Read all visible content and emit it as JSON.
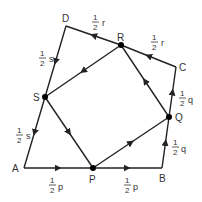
{
  "diagram": {
    "vertices": {
      "A": {
        "label": "A",
        "x": 24,
        "y": 168
      },
      "B": {
        "label": "B",
        "x": 162,
        "y": 168
      },
      "C": {
        "label": "C",
        "x": 176,
        "y": 67
      },
      "D": {
        "label": "D",
        "x": 66,
        "y": 26
      }
    },
    "midpoints": {
      "P": {
        "label": "P",
        "x": 93,
        "y": 168
      },
      "Q": {
        "label": "Q",
        "x": 169,
        "y": 117
      },
      "R": {
        "label": "R",
        "x": 121,
        "y": 45
      },
      "S": {
        "label": "S",
        "x": 45,
        "y": 97
      }
    },
    "side_labels": {
      "AP": {
        "num": "1",
        "den": "2",
        "var": "p"
      },
      "PB": {
        "num": "1",
        "den": "2",
        "var": "p"
      },
      "BQ": {
        "num": "1",
        "den": "2",
        "var": "q"
      },
      "QC": {
        "num": "1",
        "den": "2",
        "var": "q"
      },
      "DR": {
        "num": "1",
        "den": "2",
        "var": "r"
      },
      "RC": {
        "num": "1",
        "den": "2",
        "var": "r"
      },
      "DS": {
        "num": "1",
        "den": "2",
        "var": "s"
      },
      "SA": {
        "num": "1",
        "den": "2",
        "var": "s"
      }
    },
    "colors": {
      "stroke": "#222222",
      "text": "#333333",
      "point": "#000000"
    }
  }
}
